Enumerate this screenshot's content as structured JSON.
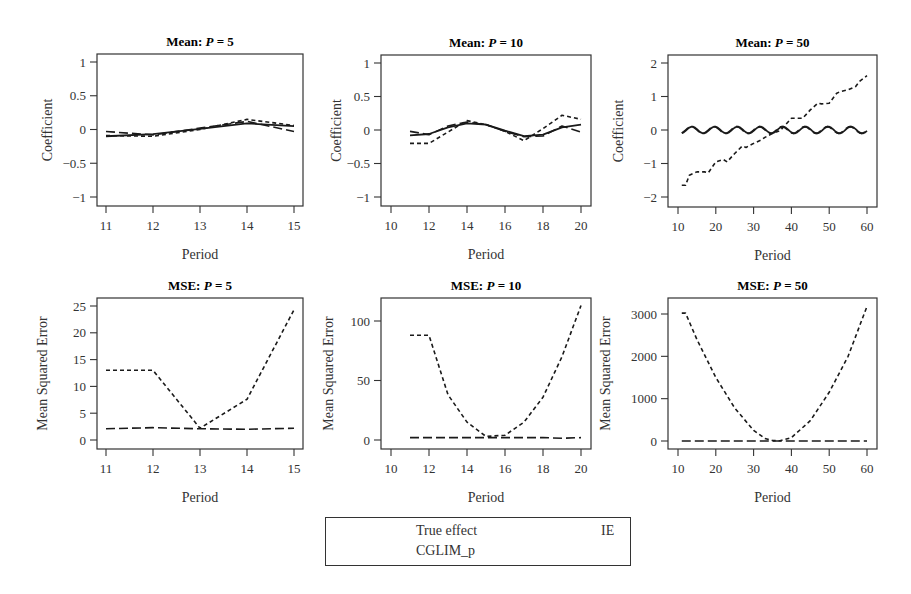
{
  "legend": {
    "items": [
      {
        "label": "True effect",
        "style": "solid"
      },
      {
        "label": "IE",
        "style": "longdash"
      },
      {
        "label": "CGLIM_p",
        "style": "shortdash"
      }
    ]
  },
  "chart_data": [
    {
      "type": "line",
      "title": "Mean: P = 5",
      "xlabel": "Period",
      "ylabel": "Coefficient",
      "xlim": [
        11,
        15
      ],
      "ylim": [
        -1,
        1
      ],
      "xticks": [
        11,
        12,
        13,
        14,
        15
      ],
      "yticks": [
        -1,
        -0.5,
        0,
        0.5,
        1
      ],
      "x": [
        11,
        12,
        13,
        14,
        15
      ],
      "series": [
        {
          "name": "True effect",
          "values": [
            -0.1,
            -0.07,
            0.01,
            0.09,
            0.05
          ]
        },
        {
          "name": "IE",
          "values": [
            -0.03,
            -0.08,
            0.02,
            0.12,
            -0.03
          ]
        },
        {
          "name": "CGLIM_p",
          "values": [
            -0.09,
            -0.1,
            0.0,
            0.15,
            0.06
          ]
        }
      ]
    },
    {
      "type": "line",
      "title": "Mean: P = 10",
      "xlabel": "Period",
      "ylabel": "Coefficient",
      "xlim": [
        10,
        20
      ],
      "ylim": [
        -1,
        1
      ],
      "xticks": [
        10,
        12,
        14,
        16,
        18,
        20
      ],
      "yticks": [
        -1,
        -0.5,
        0,
        0.5,
        1
      ],
      "x": [
        11,
        12,
        13,
        14,
        15,
        16,
        17,
        18,
        19,
        20
      ],
      "series": [
        {
          "name": "True effect",
          "values": [
            -0.08,
            -0.06,
            0.04,
            0.1,
            0.08,
            -0.01,
            -0.09,
            -0.07,
            0.04,
            0.08
          ]
        },
        {
          "name": "IE",
          "values": [
            -0.02,
            -0.07,
            0.06,
            0.12,
            0.08,
            -0.02,
            -0.1,
            -0.09,
            0.06,
            -0.03
          ]
        },
        {
          "name": "CGLIM_p",
          "values": [
            -0.2,
            -0.2,
            -0.03,
            0.14,
            0.08,
            -0.02,
            -0.16,
            0.02,
            0.22,
            0.16
          ]
        }
      ]
    },
    {
      "type": "line",
      "title": "Mean: P = 50",
      "xlabel": "Period",
      "ylabel": "Coefficient",
      "xlim": [
        10,
        60
      ],
      "ylim": [
        -2,
        2
      ],
      "xticks": [
        10,
        20,
        30,
        40,
        50,
        60
      ],
      "yticks": [
        -2,
        -1,
        0,
        1,
        2
      ],
      "x_range": [
        11,
        60
      ],
      "series": [
        {
          "name": "True effect",
          "description": "oscillates around 0 with amplitude ~0.1, period ~6"
        },
        {
          "name": "IE",
          "description": "oscillates around 0 with amplitude ~0.1, period ~6"
        },
        {
          "name": "CGLIM_p",
          "x": [
            11,
            12,
            13,
            15,
            17,
            18,
            20,
            22,
            23,
            25,
            27,
            28,
            30,
            32,
            33,
            35,
            37,
            38,
            40,
            42,
            43,
            45,
            47,
            48,
            50,
            52,
            53,
            55,
            57,
            58,
            60
          ],
          "values": [
            -1.65,
            -1.65,
            -1.35,
            -1.25,
            -1.25,
            -1.28,
            -0.95,
            -0.88,
            -0.95,
            -0.7,
            -0.48,
            -0.52,
            -0.4,
            -0.3,
            -0.22,
            -0.1,
            -0.02,
            0.1,
            0.35,
            0.35,
            0.35,
            0.6,
            0.8,
            0.78,
            0.8,
            1.1,
            1.15,
            1.2,
            1.3,
            1.45,
            1.62
          ]
        }
      ]
    },
    {
      "type": "line",
      "title": "MSE: P = 5",
      "xlabel": "Period",
      "ylabel": "Mean Squared Error",
      "xlim": [
        11,
        15
      ],
      "ylim": [
        0,
        25
      ],
      "xticks": [
        11,
        12,
        13,
        14,
        15
      ],
      "yticks": [
        0,
        5,
        10,
        15,
        20,
        25
      ],
      "x": [
        11,
        12,
        13,
        14,
        15
      ],
      "series": [
        {
          "name": "IE",
          "values": [
            2.1,
            2.3,
            2.1,
            2.0,
            2.2
          ]
        },
        {
          "name": "CGLIM_p",
          "values": [
            13,
            13,
            2.2,
            7.6,
            24.3
          ]
        }
      ]
    },
    {
      "type": "line",
      "title": "MSE: P = 10",
      "xlabel": "Period",
      "ylabel": "Mean Squared Error",
      "xlim": [
        10,
        20
      ],
      "ylim": [
        0,
        110
      ],
      "xticks": [
        10,
        12,
        14,
        16,
        18,
        20
      ],
      "yticks": [
        0,
        50,
        100
      ],
      "x": [
        11,
        12,
        13,
        14,
        15,
        16,
        17,
        18,
        19,
        20
      ],
      "series": [
        {
          "name": "IE",
          "values": [
            2,
            2,
            2,
            2,
            2,
            2,
            2,
            2,
            1.5,
            2
          ]
        },
        {
          "name": "CGLIM_p",
          "values": [
            88,
            88,
            38,
            15,
            3,
            4,
            15,
            36,
            70,
            113
          ]
        }
      ]
    },
    {
      "type": "line",
      "title": "MSE: P = 50",
      "xlabel": "Period",
      "ylabel": "Mean Squared Error",
      "xlim": [
        10,
        60
      ],
      "ylim": [
        0,
        3000
      ],
      "xticks": [
        10,
        20,
        30,
        40,
        50,
        60
      ],
      "yticks": [
        0,
        1000,
        2000,
        3000
      ],
      "x": [
        11,
        12,
        15,
        20,
        25,
        30,
        33,
        35,
        37,
        40,
        45,
        50,
        55,
        60
      ],
      "series": [
        {
          "name": "IE",
          "values": [
            0,
            0,
            0,
            0,
            0,
            0,
            0,
            0,
            0,
            0,
            0,
            0,
            0,
            0
          ]
        },
        {
          "name": "CGLIM_p",
          "values": [
            3020,
            3020,
            2400,
            1500,
            780,
            250,
            60,
            10,
            5,
            80,
            480,
            1150,
            2000,
            3180
          ]
        }
      ]
    }
  ]
}
